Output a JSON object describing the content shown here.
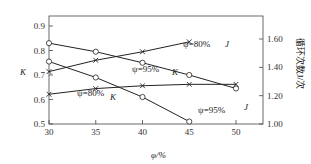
{
  "chart_data": {
    "type": "line",
    "title": "",
    "xlabel": "φ/%",
    "ylabel_left": "K",
    "ylabel_right": "循环次数J/次",
    "x_ticks": [
      "30",
      "35",
      "40",
      "45",
      "50"
    ],
    "xlim": [
      30,
      52.9
    ],
    "ylim_left": [
      0.5,
      0.94
    ],
    "ylim_right": [
      1.0,
      1.77
    ],
    "y_left_ticks": [
      "0.5",
      "0.6",
      "0.7",
      "0.8",
      "0.9"
    ],
    "y_right_ticks": [
      "1.00",
      "1.20",
      "1.40",
      "1.60"
    ],
    "grid": false,
    "series": [
      {
        "name": "K ψ=95%",
        "axis": "left",
        "marker": "circle",
        "x": [
          30,
          35,
          40,
          45,
          50
        ],
        "values": [
          0.83,
          0.795,
          0.75,
          0.7,
          0.645
        ]
      },
      {
        "name": "K ψ=80%",
        "axis": "left",
        "marker": "circle",
        "x": [
          30,
          35,
          40,
          45
        ],
        "values": [
          0.755,
          0.69,
          0.61,
          0.51
        ]
      },
      {
        "name": "J ψ=80%",
        "axis": "right",
        "marker": "cross",
        "x": [
          30,
          35,
          40,
          45
        ],
        "values": [
          1.37,
          1.45,
          1.51,
          1.58
        ]
      },
      {
        "name": "J ψ=95%",
        "axis": "right",
        "marker": "cross",
        "x": [
          30,
          35,
          40,
          45,
          50
        ],
        "values": [
          1.21,
          1.25,
          1.27,
          1.28,
          1.28
        ]
      }
    ],
    "annotations": [
      {
        "text": "ψ=80%",
        "x": 183,
        "y": 47
      },
      {
        "text": "J",
        "x": 225,
        "y": 47,
        "italic": true
      },
      {
        "text": "ψ=95%",
        "x": 132,
        "y": 72
      },
      {
        "text": "K",
        "x": 172,
        "y": 75,
        "italic": true
      },
      {
        "text": "ψ=80%",
        "x": 77,
        "y": 96
      },
      {
        "text": "K",
        "x": 110,
        "y": 100,
        "italic": true
      },
      {
        "text": "ψ=95%",
        "x": 198,
        "y": 113
      },
      {
        "text": "J",
        "x": 244,
        "y": 110,
        "italic": true
      }
    ]
  }
}
